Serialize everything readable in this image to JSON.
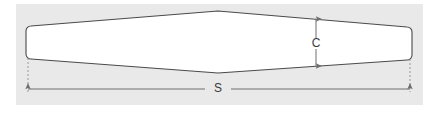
{
  "figure": {
    "background_color": "#ffffff",
    "plot_background_color": "#e9e9e9",
    "shape_fill_color": "#ffffff",
    "outline_color": "#4a4a4a",
    "dimension_line_color": "#6e6e6e",
    "extension_line_color": "#9a9a9a",
    "label_color": "#3a3a3a"
  },
  "diagram": {
    "type": "engineering-dimension-drawing",
    "shape_name": "wing-planform",
    "dimensions": [
      {
        "id": "chord",
        "label": "C",
        "orientation": "vertical",
        "arrowheads": "both",
        "label_position": "middle"
      },
      {
        "id": "span",
        "label": "S",
        "orientation": "horizontal",
        "arrowheads": "both",
        "label_position": "middle"
      }
    ]
  },
  "labels": {
    "chord": "C",
    "span": "S"
  },
  "geometry": {
    "plot_area": {
      "x": 16,
      "y": 4,
      "width": 407,
      "height": 101
    },
    "shape": {
      "left_x": 26,
      "right_x": 412,
      "left_top_y": 26,
      "left_bottom_y": 59,
      "right_top_y": 27,
      "right_bottom_y": 60,
      "apex_x": 218,
      "apex_top_y": 11,
      "apex_bottom_y": 73,
      "corner_radius": 5
    },
    "chord_dimension": {
      "x": 316,
      "y_top": 19,
      "y_bottom": 66
    },
    "span_dimension": {
      "y": 89,
      "x_left": 28,
      "x_right": 410
    },
    "extension_lines": [
      {
        "x": 28,
        "y_top": 60,
        "y_bottom": 92
      },
      {
        "x": 410,
        "y_top": 61,
        "y_bottom": 92
      }
    ]
  }
}
